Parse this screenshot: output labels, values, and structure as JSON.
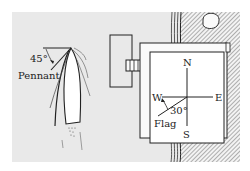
{
  "diagram": {
    "type": "physics-vector-diagram",
    "background_color": "#e9e9e9",
    "line_color": "#222222",
    "boat": {
      "pennant_label": "Pennant",
      "pennant_angle_label": "45°",
      "pennant_angle_deg": 45
    },
    "dock": {
      "compass": {
        "north": "N",
        "south": "S",
        "east": "E",
        "west": "W"
      },
      "flag_label": "Flag",
      "flag_angle_label": "30°",
      "flag_angle_deg": 30
    }
  }
}
